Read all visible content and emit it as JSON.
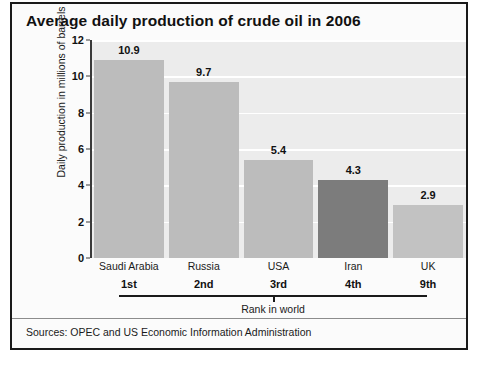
{
  "chart_data": {
    "type": "bar",
    "title": "Average daily production of crude oil in 2006",
    "categories": [
      "Saudi Arabia",
      "Russia",
      "USA",
      "Iran",
      "UK"
    ],
    "values": [
      10.9,
      9.7,
      5.4,
      4.3,
      2.9
    ],
    "value_labels": [
      "10.9",
      "9.7",
      "5.4",
      "4.3",
      "2.9"
    ],
    "ranks": [
      "1st",
      "2nd",
      "3rd",
      "4th",
      "9th"
    ],
    "rank_axis_label": "Rank in world",
    "xlabel": "",
    "ylabel": "Daily production in millions of barrels",
    "ylim": [
      0,
      12
    ],
    "ytick_labels": [
      "0",
      "2",
      "4",
      "6",
      "8",
      "10",
      "12"
    ],
    "ytick_values": [
      0,
      2,
      4,
      6,
      8,
      10,
      12
    ],
    "grid": true,
    "legend": false,
    "bar_colors": [
      "#bcbcbc",
      "#bcbcbc",
      "#bcbcbc",
      "#7c7c7c",
      "#c2c2c2"
    ],
    "plot_background": "#ececec",
    "gridline_color": "#ffffff"
  },
  "footer": {
    "sources": "Sources: OPEC and US Economic Information Administration"
  }
}
